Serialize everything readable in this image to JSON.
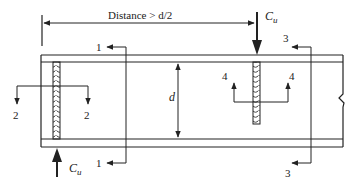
{
  "diagram": {
    "dimension_label": "Distance > d/2",
    "depth_label": "d",
    "loads": [
      {
        "id": "load-top",
        "label": "C",
        "subscript": "u",
        "direction": "down"
      },
      {
        "id": "load-bottom",
        "label": "C",
        "subscript": "u",
        "direction": "up"
      }
    ],
    "sections": [
      {
        "id": "1",
        "labels": [
          "1",
          "1"
        ]
      },
      {
        "id": "2",
        "labels": [
          "2",
          "2"
        ]
      },
      {
        "id": "3",
        "labels": [
          "3",
          "3"
        ]
      },
      {
        "id": "4",
        "labels": [
          "4",
          "4"
        ]
      }
    ],
    "colors": {
      "line": "#222222",
      "background": "#ffffff"
    }
  }
}
